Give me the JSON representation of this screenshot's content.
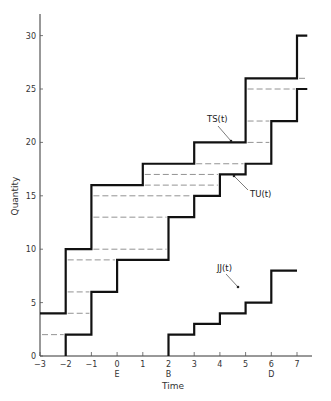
{
  "chart_data": {
    "type": "line",
    "subtype": "step",
    "title": "",
    "xlabel": "Time",
    "ylabel": "Quantity",
    "xlim": [
      -3,
      7.4
    ],
    "ylim": [
      0,
      32
    ],
    "grid": false,
    "x_ticks": [
      -3,
      -2,
      -1,
      0,
      1,
      2,
      3,
      4,
      5,
      6,
      7
    ],
    "x_tick_labels": [
      "-3",
      "-2",
      "-1",
      "0",
      "1",
      "2",
      "3",
      "4",
      "5",
      "6",
      "7"
    ],
    "x_sublabels": [
      {
        "x": 0,
        "label": "E"
      },
      {
        "x": 2,
        "label": "B"
      },
      {
        "x": 6,
        "label": "D"
      }
    ],
    "y_ticks": [
      0,
      5,
      10,
      15,
      20,
      25,
      30
    ],
    "y_tick_labels": [
      "0",
      "5",
      "10",
      "15",
      "20",
      "25",
      "30"
    ],
    "series": [
      {
        "name": "TS(t)",
        "style": "solid-thick",
        "steps": [
          {
            "x0": -3,
            "x1": -2,
            "y": 4
          },
          {
            "x0": -2,
            "x1": -1,
            "y": 10
          },
          {
            "x0": -1,
            "x1": 1,
            "y": 16
          },
          {
            "x0": 1,
            "x1": 3,
            "y": 18
          },
          {
            "x0": 3,
            "x1": 5,
            "y": 20
          },
          {
            "x0": 5,
            "x1": 7,
            "y": 26
          },
          {
            "x0": 7,
            "x1": 7.4,
            "y": 30
          }
        ]
      },
      {
        "name": "TU(t)",
        "style": "solid-thick",
        "steps": [
          {
            "x0": -2,
            "x1": -1,
            "y": 2
          },
          {
            "x0": -1,
            "x1": 0,
            "y": 6
          },
          {
            "x0": 0,
            "x1": 2,
            "y": 9
          },
          {
            "x0": 2,
            "x1": 3,
            "y": 13
          },
          {
            "x0": 3,
            "x1": 4,
            "y": 15
          },
          {
            "x0": 4,
            "x1": 5,
            "y": 17
          },
          {
            "x0": 5,
            "x1": 6,
            "y": 18
          },
          {
            "x0": 6,
            "x1": 7,
            "y": 22
          },
          {
            "x0": 7,
            "x1": 7.4,
            "y": 25
          }
        ]
      },
      {
        "name": "JJ(t)",
        "style": "solid-thick",
        "steps": [
          {
            "x0": 2,
            "x1": 3,
            "y": 2
          },
          {
            "x0": 3,
            "x1": 4,
            "y": 3
          },
          {
            "x0": 4,
            "x1": 5,
            "y": 4
          },
          {
            "x0": 5,
            "x1": 6,
            "y": 5
          },
          {
            "x0": 6,
            "x1": 7,
            "y": 8
          }
        ]
      }
    ],
    "dashed_levels": [
      {
        "x0": -3,
        "x1": -2,
        "y": 2
      },
      {
        "x0": -2,
        "x1": -1,
        "y": 4
      },
      {
        "x0": -2,
        "x1": -1,
        "y": 6
      },
      {
        "x0": -2,
        "x1": 0,
        "y": 9
      },
      {
        "x0": -1,
        "x1": 2,
        "y": 10
      },
      {
        "x0": -1,
        "x1": 2,
        "y": 13
      },
      {
        "x0": -1,
        "x1": 3,
        "y": 15
      },
      {
        "x0": 1,
        "x1": 4,
        "y": 16
      },
      {
        "x0": 1,
        "x1": 4,
        "y": 17
      },
      {
        "x0": 3,
        "x1": 5,
        "y": 18
      },
      {
        "x0": 5,
        "x1": 6,
        "y": 20
      },
      {
        "x0": 5,
        "x1": 6,
        "y": 22
      },
      {
        "x0": 5,
        "x1": 7,
        "y": 25
      },
      {
        "x0": 7,
        "x1": 7.4,
        "y": 26
      }
    ],
    "annotations": [
      {
        "text": "TS(t)",
        "points_to": {
          "x": 3.7,
          "y": 20
        }
      },
      {
        "text": "TU(t)",
        "points_to": {
          "x": 4.3,
          "y": 17
        }
      },
      {
        "text": "JJ(t)",
        "points_to": {
          "x": 6,
          "y": 6.5
        }
      }
    ]
  }
}
